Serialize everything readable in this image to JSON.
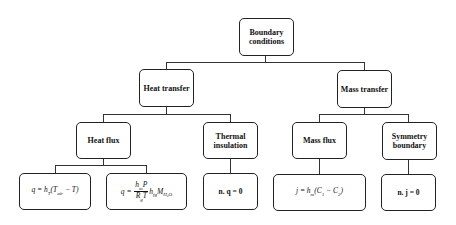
{
  "diagram": {
    "root": {
      "label_line1": "Boundary",
      "label_line2": "conditions"
    },
    "level1": [
      {
        "label": "Heat transfer"
      },
      {
        "label": "Mass transfer"
      }
    ],
    "level2": [
      {
        "label": "Heat flux"
      },
      {
        "label_line1": "Thermal",
        "label_line2": "insulation"
      },
      {
        "label": "Mass flux"
      },
      {
        "label_line1": "Symmetry",
        "label_line2": "boundary"
      }
    ],
    "level3": [
      {
        "q": "q = h",
        "sub_t": "T",
        "rest": "(T",
        "sub_air": "air",
        "rest2": " − T)"
      },
      {
        "q": "q =",
        "num": "h",
        "num_sub": "m",
        "num_p": "P",
        "den": "R",
        "den_sub": "g",
        "den_t": "T",
        "h": "h",
        "h_sub": "fg",
        "m": "M",
        "m_sub": "H₂O"
      },
      {
        "label": "n. q = 0"
      },
      {
        "j": "j = h",
        "j_sub": "m",
        "rest": "(C",
        "c1_sub": "1",
        "minus": " − C",
        "c2_sub": "2",
        "close": ")"
      },
      {
        "label": "n. j = 0"
      }
    ]
  }
}
